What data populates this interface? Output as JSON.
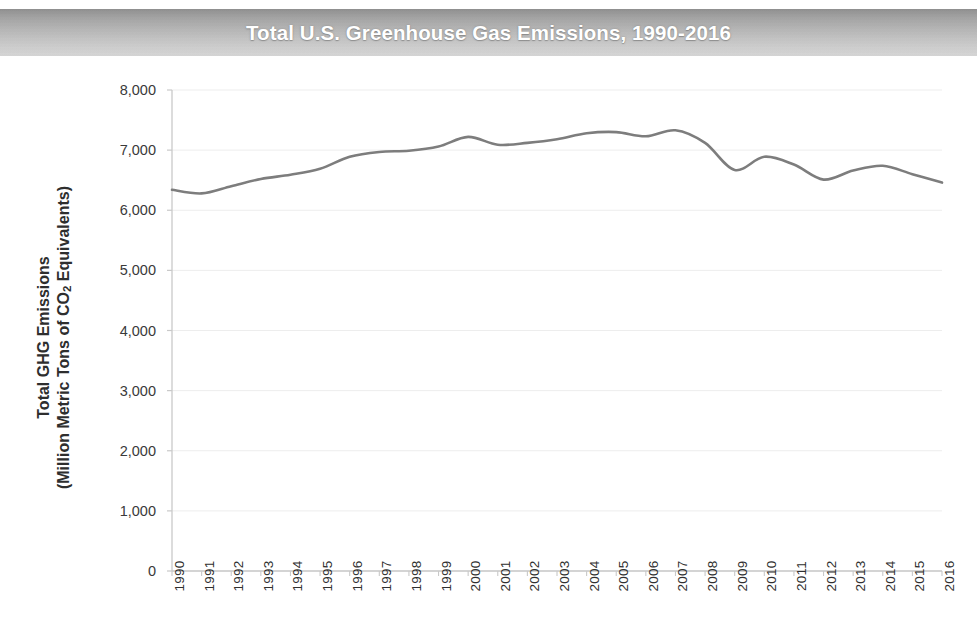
{
  "chart_data": {
    "type": "line",
    "title": "Total U.S. Greenhouse Gas Emissions, 1990-2016",
    "xlabel": "",
    "ylabel": "Total GHG  Emissions (Million Metric Tons of CO2 Equivalents)",
    "ylabel_line1": "Total GHG  Emissions",
    "ylabel_line2_pre": "(Million Metric Tons of CO",
    "ylabel_line2_sub": "2",
    "ylabel_line2_post": " Equivalents)",
    "categories": [
      "1990",
      "1991",
      "1992",
      "1993",
      "1994",
      "1995",
      "1996",
      "1997",
      "1998",
      "1999",
      "2000",
      "2001",
      "2002",
      "2003",
      "2004",
      "2005",
      "2006",
      "2007",
      "2008",
      "2009",
      "2010",
      "2011",
      "2012",
      "2013",
      "2014",
      "2015",
      "2016"
    ],
    "values": [
      6340,
      6280,
      6400,
      6520,
      6590,
      6690,
      6890,
      6970,
      6990,
      7060,
      7220,
      7090,
      7120,
      7180,
      7280,
      7300,
      7230,
      7330,
      7120,
      6670,
      6890,
      6760,
      6510,
      6660,
      6740,
      6600,
      6460
    ],
    "ylim": [
      0,
      8000
    ],
    "y_ticks": [
      8000,
      7000,
      6000,
      5000,
      4000,
      3000,
      2000,
      1000,
      0
    ],
    "y_tick_labels": [
      "8,000",
      "7,000",
      "6,000",
      "5,000",
      "4,000",
      "3,000",
      "2,000",
      "1,000",
      "0"
    ],
    "grid": true,
    "grid_axis": "y",
    "legend": null,
    "legend_position": "none",
    "series_color": "#7d7d7d",
    "grid_color": "#ededed",
    "axis_color": "#c9c9c9",
    "title_text_color": "#ffffff",
    "title_band_color": "#b4b4b4",
    "annotations": []
  }
}
